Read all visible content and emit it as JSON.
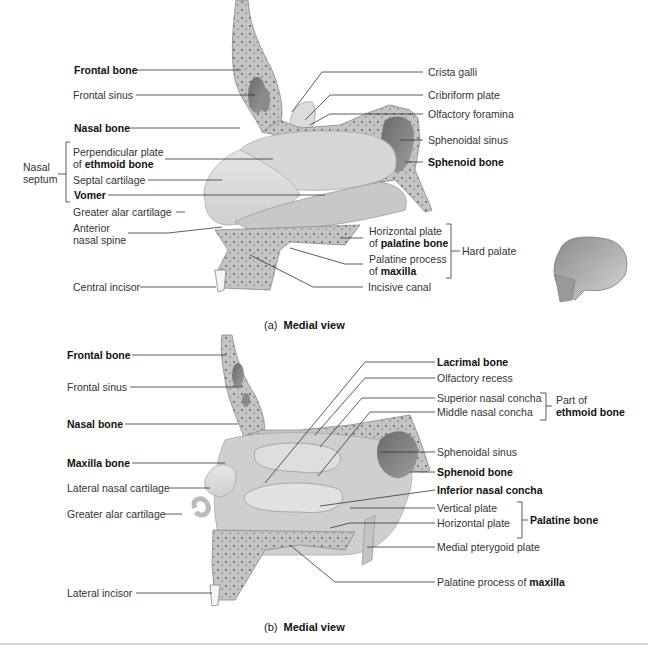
{
  "panel_a": {
    "caption_prefix": "(a)",
    "caption_title": "Medial view",
    "left_labels": {
      "frontal_bone": "Frontal bone",
      "frontal_sinus": "Frontal sinus",
      "nasal_bone": "Nasal bone",
      "perpendicular_plate_1": "Perpendicular plate",
      "perpendicular_plate_2_prefix": "of ",
      "perpendicular_plate_2_bold": "ethmoid bone",
      "septal_cartilage": "Septal cartilage",
      "vomer": "Vomer",
      "greater_alar_cartilage": "Greater alar cartilage",
      "anterior_nasal_spine_1": "Anterior",
      "anterior_nasal_spine_2": "nasal spine",
      "central_incisor": "Central incisor",
      "nasal_septum_1": "Nasal",
      "nasal_septum_2": "septum"
    },
    "right_labels": {
      "crista_galli": "Crista galli",
      "cribriform_plate": "Cribriform plate",
      "olfactory_foramina": "Olfactory foramina",
      "sphenoidal_sinus": "Sphenoidal sinus",
      "sphenoid_bone": "Sphenoid bone",
      "horizontal_plate_1": "Horizontal plate",
      "horizontal_plate_2_prefix": "of ",
      "horizontal_plate_2_bold": "palatine bone",
      "palatine_process_1": "Palatine process",
      "palatine_process_2_prefix": "of ",
      "palatine_process_2_bold": "maxilla",
      "incisive_canal": "Incisive canal",
      "hard_palate": "Hard palate"
    }
  },
  "panel_b": {
    "caption_prefix": "(b)",
    "caption_title": "Medial view",
    "left_labels": {
      "frontal_bone": "Frontal bone",
      "frontal_sinus": "Frontal sinus",
      "nasal_bone": "Nasal bone",
      "maxilla_bone": "Maxilla bone",
      "lateral_nasal_cartilage": "Lateral nasal cartilage",
      "greater_alar_cartilage": "Greater alar cartilage",
      "lateral_incisor": "Lateral incisor"
    },
    "right_labels": {
      "lacrimal_bone": "Lacrimal bone",
      "olfactory_recess": "Olfactory recess",
      "superior_nasal_concha": "Superior nasal concha",
      "middle_nasal_concha": "Middle nasal concha",
      "part_of_1": "Part of",
      "part_of_2": "ethmoid bone",
      "sphenoidal_sinus": "Sphenoidal sinus",
      "sphenoid_bone": "Sphenoid bone",
      "inferior_nasal_concha": "Inferior nasal concha",
      "vertical_plate": "Vertical plate",
      "horizontal_plate": "Horizontal plate",
      "palatine_bone": "Palatine bone",
      "medial_pterygoid_plate": "Medial pterygoid plate",
      "palatine_process_prefix": "Palatine process of ",
      "palatine_process_bold": "maxilla"
    }
  },
  "colors": {
    "bone": "#c9c9c9",
    "bone_dark": "#9a9a9a",
    "cartilage": "#e2e2e2",
    "sinus": "#7d7d7d",
    "leader_line": "#333333"
  }
}
